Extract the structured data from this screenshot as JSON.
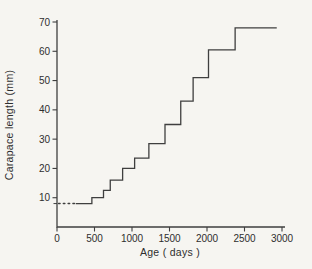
{
  "figure": {
    "background_color": "#f6f5f1",
    "line_color": "#3f3f3f",
    "text_color": "#2e2e2e"
  },
  "chart_data": {
    "type": "line",
    "subtype": "step-post",
    "title": "",
    "xlabel": "Age ( days )",
    "ylabel": "Carapace length (mm)",
    "xlim": [
      0,
      3000
    ],
    "ylim": [
      0,
      70
    ],
    "x_ticks": [
      0,
      500,
      1000,
      1500,
      2000,
      2500,
      3000
    ],
    "y_ticks": [
      10,
      20,
      30,
      40,
      50,
      60,
      70
    ],
    "extra_y_tick_mm": 8,
    "grid": false,
    "legend": null,
    "hatch_line": {
      "length_mm": 8,
      "age_from": 0,
      "age_to": 250,
      "style": "dotted"
    },
    "plateaus": [
      {
        "length_mm": 8,
        "age_from": 250,
        "age_to": 465
      },
      {
        "length_mm": 10,
        "age_from": 465,
        "age_to": 620
      },
      {
        "length_mm": 12.5,
        "age_from": 620,
        "age_to": 710
      },
      {
        "length_mm": 16,
        "age_from": 710,
        "age_to": 875
      },
      {
        "length_mm": 20,
        "age_from": 875,
        "age_to": 1035
      },
      {
        "length_mm": 23.5,
        "age_from": 1035,
        "age_to": 1225
      },
      {
        "length_mm": 28.5,
        "age_from": 1225,
        "age_to": 1440
      },
      {
        "length_mm": 35,
        "age_from": 1440,
        "age_to": 1650
      },
      {
        "length_mm": 43,
        "age_from": 1650,
        "age_to": 1815
      },
      {
        "length_mm": 51,
        "age_from": 1815,
        "age_to": 2020
      },
      {
        "length_mm": 60.5,
        "age_from": 2020,
        "age_to": 2375
      },
      {
        "length_mm": 68,
        "age_from": 2375,
        "age_to": 2930
      }
    ]
  }
}
